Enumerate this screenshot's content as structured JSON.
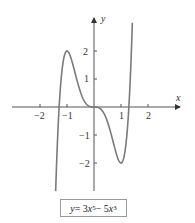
{
  "chart_data": {
    "type": "line",
    "title": "",
    "xlabel": "x",
    "ylabel": "y",
    "equation": "y = 3x^5 - 5x^3",
    "x_ticks": [
      -2,
      -1,
      1,
      2
    ],
    "y_ticks": [
      -2,
      -1,
      1,
      2
    ],
    "xlim": [
      -3,
      3.2
    ],
    "ylim": [
      -3,
      3.1
    ],
    "grid": false,
    "series": [
      {
        "name": "y = 3x^5 - 5x^3",
        "x": [
          -1.42,
          -1.3,
          -1.2,
          -1.1,
          -1.0,
          -0.8,
          -0.6,
          -0.4,
          -0.2,
          0,
          0.2,
          0.4,
          0.6,
          0.8,
          1.0,
          1.1,
          1.2,
          1.3,
          1.42
        ],
        "y": [
          -3.01,
          0.29,
          1.17,
          1.82,
          2.0,
          1.58,
          0.85,
          0.29,
          0.04,
          0,
          -0.04,
          -0.29,
          -0.85,
          -1.58,
          -2.0,
          -1.82,
          -1.17,
          -0.29,
          3.01
        ]
      }
    ],
    "critical_points": [
      {
        "x": -1,
        "y": 2,
        "label": "local max"
      },
      {
        "x": 1,
        "y": -2,
        "label": "local min"
      },
      {
        "x": 0,
        "y": 0,
        "label": "inflection"
      }
    ],
    "color": "#7a7a7a"
  },
  "labels": {
    "x_axis": "x",
    "y_axis": "y",
    "x_ticks": [
      "−2",
      "−1",
      "1",
      "2"
    ],
    "y_ticks": [
      "2",
      "1",
      "−1",
      "−2"
    ]
  },
  "equation": {
    "lhs": "y",
    "eq": " = 3",
    "x1": "x",
    "p1": "5",
    "minus": " − 5",
    "x2": "x",
    "p2": "3"
  }
}
